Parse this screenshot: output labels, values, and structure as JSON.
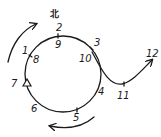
{
  "diagram": {
    "direction_label": "北",
    "rotation": "clockwise",
    "colors": {
      "ink": "#1a1a1a",
      "background": "#ffffff"
    },
    "points": [
      {
        "id": "1",
        "label": "1",
        "x": 22,
        "y": 54
      },
      {
        "id": "2",
        "label": "2",
        "x": 56,
        "y": 31
      },
      {
        "id": "3",
        "label": "3",
        "x": 94,
        "y": 46
      },
      {
        "id": "4",
        "label": "4",
        "x": 100,
        "y": 95
      },
      {
        "id": "5",
        "label": "5",
        "x": 74,
        "y": 121
      },
      {
        "id": "6",
        "label": "6",
        "x": 31,
        "y": 112
      },
      {
        "id": "7",
        "label": "7",
        "x": 12,
        "y": 86
      },
      {
        "id": "8",
        "label": "8",
        "x": 32,
        "y": 62
      },
      {
        "id": "9",
        "label": "9",
        "x": 55,
        "y": 48
      },
      {
        "id": "10",
        "label": "10",
        "x": 79,
        "y": 62
      },
      {
        "id": "11",
        "label": "11",
        "x": 118,
        "y": 99
      },
      {
        "id": "12",
        "label": "12",
        "x": 146,
        "y": 56
      }
    ],
    "start_marker": "triangle-at-7"
  }
}
